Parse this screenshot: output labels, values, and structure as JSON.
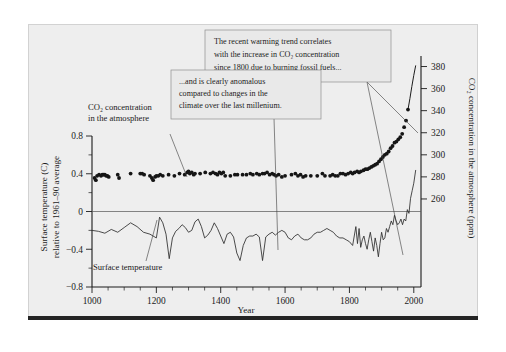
{
  "figure": {
    "background_color": "#eeeeee",
    "page_color": "#ffffff",
    "bottom_bar_color": "#242424"
  },
  "axes": {
    "x": {
      "title": "Year",
      "ticks": [
        "1000",
        "1200",
        "1400",
        "1600",
        "1800",
        "2000"
      ],
      "tick_values": [
        1000,
        1200,
        1400,
        1600,
        1800,
        2000
      ],
      "minor_step": 50,
      "range": [
        1000,
        2010
      ]
    },
    "y_left": {
      "title_line1": "Surface temperature (C)",
      "title_line2": "relative to 1961–90 average",
      "ticks": [
        "0.8",
        "0.4",
        "0",
        "−0.4",
        "−0.8"
      ],
      "tick_values": [
        0.8,
        0.4,
        0,
        -0.4,
        -0.8
      ],
      "range": [
        -0.8,
        0.8
      ]
    },
    "y_right": {
      "title": "CO₂ concentration in the atmosphere (ppm)",
      "ticks": [
        "380",
        "360",
        "340",
        "320",
        "300",
        "280",
        "260"
      ],
      "tick_values": [
        380,
        360,
        340,
        320,
        300,
        280,
        260
      ],
      "range": [
        250,
        385
      ]
    }
  },
  "annotations": {
    "callout1": {
      "line1": "The recent warming trend correlates",
      "line2": "with the increase in CO₂ concentration",
      "line3": "since 1800 due to burning fossil fuels..."
    },
    "callout2": {
      "line1": "...and is clearly anomalous",
      "line2": "compared to changes in the",
      "line3": "climate over the last millenium."
    },
    "co2_label": {
      "line1": "CO₂ concentration",
      "line2": "in the atmosphere"
    },
    "temp_label": {
      "line1": "Surface temperature"
    }
  },
  "chart_data": {
    "type": "line",
    "title": "",
    "xlabel": "Year",
    "ylabel": "Surface temperature (C) relative to 1961-90 average",
    "ylabel_right": "CO2 concentration in the atmosphere (ppm)",
    "xlim": [
      1000,
      2010
    ],
    "ylim_left": [
      -0.8,
      0.8
    ],
    "ylim_right": [
      250,
      385
    ],
    "grid": false,
    "legend_position": "inline-annotations",
    "series": [
      {
        "name": "CO2 concentration in the atmosphere",
        "type": "scatter",
        "axis": "right",
        "units": "ppm",
        "points": [
          [
            1008,
            279
          ],
          [
            1012,
            277
          ],
          [
            1016,
            281
          ],
          [
            1022,
            282
          ],
          [
            1028,
            281
          ],
          [
            1032,
            282
          ],
          [
            1036,
            282
          ],
          [
            1040,
            282
          ],
          [
            1044,
            281
          ],
          [
            1048,
            281
          ],
          [
            1052,
            280
          ],
          [
            1080,
            282
          ],
          [
            1084,
            279
          ],
          [
            1120,
            283
          ],
          [
            1150,
            283
          ],
          [
            1156,
            283
          ],
          [
            1162,
            282
          ],
          [
            1180,
            281
          ],
          [
            1186,
            279
          ],
          [
            1190,
            277
          ],
          [
            1196,
            280
          ],
          [
            1200,
            281
          ],
          [
            1206,
            281
          ],
          [
            1212,
            282
          ],
          [
            1220,
            281
          ],
          [
            1238,
            282
          ],
          [
            1256,
            281
          ],
          [
            1272,
            283
          ],
          [
            1288,
            282
          ],
          [
            1296,
            284
          ],
          [
            1300,
            285
          ],
          [
            1304,
            283
          ],
          [
            1310,
            284
          ],
          [
            1316,
            282
          ],
          [
            1320,
            283
          ],
          [
            1336,
            283
          ],
          [
            1352,
            284
          ],
          [
            1368,
            283
          ],
          [
            1376,
            284
          ],
          [
            1384,
            283
          ],
          [
            1390,
            282
          ],
          [
            1396,
            284
          ],
          [
            1402,
            283
          ],
          [
            1408,
            284
          ],
          [
            1414,
            281
          ],
          [
            1430,
            281
          ],
          [
            1444,
            282
          ],
          [
            1452,
            282
          ],
          [
            1468,
            282
          ],
          [
            1480,
            282
          ],
          [
            1492,
            283
          ],
          [
            1500,
            282
          ],
          [
            1512,
            283
          ],
          [
            1520,
            282
          ],
          [
            1530,
            283
          ],
          [
            1536,
            283
          ],
          [
            1544,
            284
          ],
          [
            1552,
            282
          ],
          [
            1560,
            283
          ],
          [
            1566,
            282
          ],
          [
            1572,
            281
          ],
          [
            1580,
            282
          ],
          [
            1590,
            280
          ],
          [
            1600,
            281
          ],
          [
            1620,
            282
          ],
          [
            1632,
            283
          ],
          [
            1640,
            281
          ],
          [
            1648,
            282
          ],
          [
            1656,
            280
          ],
          [
            1664,
            281
          ],
          [
            1680,
            281
          ],
          [
            1700,
            281
          ],
          [
            1716,
            283
          ],
          [
            1724,
            281
          ],
          [
            1740,
            281
          ],
          [
            1748,
            282
          ],
          [
            1756,
            281
          ],
          [
            1764,
            281
          ],
          [
            1772,
            283
          ],
          [
            1780,
            283
          ],
          [
            1788,
            282
          ],
          [
            1796,
            283
          ],
          [
            1804,
            284
          ],
          [
            1810,
            283
          ],
          [
            1816,
            284
          ],
          [
            1824,
            285
          ],
          [
            1830,
            284
          ],
          [
            1836,
            285
          ],
          [
            1844,
            286
          ],
          [
            1850,
            287
          ],
          [
            1856,
            287
          ],
          [
            1862,
            288
          ],
          [
            1868,
            289
          ],
          [
            1874,
            290
          ],
          [
            1880,
            291
          ],
          [
            1886,
            292
          ],
          [
            1892,
            294
          ],
          [
            1898,
            296
          ],
          [
            1904,
            298
          ],
          [
            1910,
            300
          ],
          [
            1916,
            301
          ],
          [
            1922,
            303
          ],
          [
            1928,
            306
          ],
          [
            1934,
            308
          ],
          [
            1940,
            311
          ],
          [
            1946,
            312
          ],
          [
            1952,
            314
          ],
          [
            1958,
            316
          ],
          [
            1964,
            319
          ],
          [
            1970,
            325
          ],
          [
            1976,
            331
          ],
          [
            1982,
            341
          ]
        ]
      },
      {
        "name": "CO2 concentration (modern instrumental)",
        "type": "line",
        "axis": "right",
        "units": "ppm",
        "points": [
          [
            1982,
            341
          ],
          [
            1988,
            351
          ],
          [
            1994,
            362
          ],
          [
            2000,
            372
          ],
          [
            2006,
            381
          ]
        ]
      },
      {
        "name": "Surface temperature",
        "type": "line",
        "axis": "left",
        "units": "C anomaly",
        "points": [
          [
            1000,
            -0.2
          ],
          [
            1020,
            -0.21
          ],
          [
            1040,
            -0.23
          ],
          [
            1060,
            -0.19
          ],
          [
            1080,
            -0.22
          ],
          [
            1100,
            -0.17
          ],
          [
            1120,
            -0.12
          ],
          [
            1140,
            -0.16
          ],
          [
            1160,
            -0.22
          ],
          [
            1180,
            -0.24
          ],
          [
            1200,
            -0.28
          ],
          [
            1210,
            -0.06
          ],
          [
            1220,
            -0.12
          ],
          [
            1230,
            -0.24
          ],
          [
            1240,
            -0.5
          ],
          [
            1250,
            -0.28
          ],
          [
            1260,
            -0.21
          ],
          [
            1270,
            -0.18
          ],
          [
            1280,
            -0.14
          ],
          [
            1290,
            -0.17
          ],
          [
            1300,
            -0.22
          ],
          [
            1310,
            -0.2
          ],
          [
            1320,
            -0.11
          ],
          [
            1330,
            -0.08
          ],
          [
            1340,
            -0.16
          ],
          [
            1350,
            -0.28
          ],
          [
            1360,
            -0.25
          ],
          [
            1370,
            -0.2
          ],
          [
            1380,
            -0.12
          ],
          [
            1390,
            -0.18
          ],
          [
            1400,
            -0.26
          ],
          [
            1410,
            -0.34
          ],
          [
            1420,
            -0.24
          ],
          [
            1430,
            -0.22
          ],
          [
            1440,
            -0.27
          ],
          [
            1450,
            -0.44
          ],
          [
            1460,
            -0.52
          ],
          [
            1470,
            -0.36
          ],
          [
            1480,
            -0.28
          ],
          [
            1490,
            -0.26
          ],
          [
            1500,
            -0.26
          ],
          [
            1510,
            -0.24
          ],
          [
            1520,
            -0.27
          ],
          [
            1530,
            -0.52
          ],
          [
            1540,
            -0.27
          ],
          [
            1550,
            -0.24
          ],
          [
            1560,
            -0.22
          ],
          [
            1570,
            -0.25
          ],
          [
            1580,
            -0.22
          ],
          [
            1590,
            -0.2
          ],
          [
            1600,
            -0.22
          ],
          [
            1610,
            -0.28
          ],
          [
            1620,
            -0.3
          ],
          [
            1630,
            -0.26
          ],
          [
            1640,
            -0.24
          ],
          [
            1650,
            -0.28
          ],
          [
            1660,
            -0.3
          ],
          [
            1670,
            -0.3
          ],
          [
            1680,
            -0.28
          ],
          [
            1690,
            -0.24
          ],
          [
            1700,
            -0.22
          ],
          [
            1710,
            -0.22
          ],
          [
            1720,
            -0.2
          ],
          [
            1730,
            -0.18
          ],
          [
            1740,
            -0.2
          ],
          [
            1750,
            -0.22
          ],
          [
            1760,
            -0.26
          ],
          [
            1770,
            -0.28
          ],
          [
            1780,
            -0.28
          ],
          [
            1790,
            -0.3
          ],
          [
            1800,
            -0.32
          ],
          [
            1810,
            -0.36
          ],
          [
            1820,
            -0.16
          ],
          [
            1825,
            -0.34
          ],
          [
            1830,
            -0.18
          ],
          [
            1835,
            -0.38
          ],
          [
            1840,
            -0.3
          ],
          [
            1845,
            -0.26
          ],
          [
            1850,
            -0.34
          ],
          [
            1855,
            -0.4
          ],
          [
            1860,
            -0.3
          ],
          [
            1865,
            -0.22
          ],
          [
            1870,
            -0.32
          ],
          [
            1875,
            -0.42
          ],
          [
            1880,
            -0.28
          ],
          [
            1885,
            -0.36
          ],
          [
            1890,
            -0.48
          ],
          [
            1895,
            -0.34
          ],
          [
            1900,
            -0.22
          ],
          [
            1905,
            -0.3
          ],
          [
            1910,
            -0.28
          ],
          [
            1915,
            -0.18
          ],
          [
            1920,
            -0.22
          ],
          [
            1925,
            -0.16
          ],
          [
            1930,
            -0.1
          ],
          [
            1935,
            -0.14
          ],
          [
            1940,
            -0.04
          ],
          [
            1945,
            -0.1
          ],
          [
            1950,
            -0.14
          ],
          [
            1955,
            -0.12
          ],
          [
            1960,
            -0.08
          ],
          [
            1965,
            -0.14
          ],
          [
            1970,
            -0.08
          ],
          [
            1975,
            -0.1
          ],
          [
            1980,
            0.02
          ],
          [
            1985,
            -0.02
          ],
          [
            1990,
            0.14
          ],
          [
            1995,
            0.22
          ],
          [
            2000,
            0.3
          ],
          [
            2006,
            0.44
          ]
        ]
      }
    ]
  }
}
